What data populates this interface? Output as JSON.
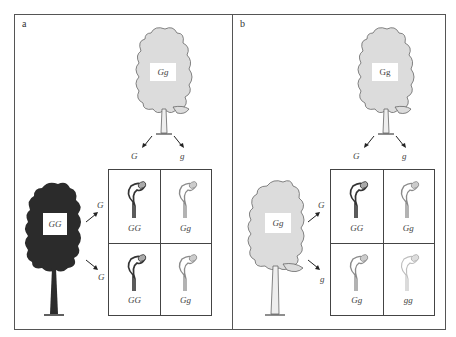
{
  "panels": [
    {
      "label": "a",
      "top_tree": {
        "genotype": "Gg",
        "shade": "light"
      },
      "top_gametes": [
        "G",
        "g"
      ],
      "left_tree": {
        "genotype": "GG",
        "shade": "dark"
      },
      "left_gametes": [
        "G",
        "G"
      ],
      "grid": [
        [
          "GG",
          "Gg"
        ],
        [
          "GG",
          "Gg"
        ]
      ],
      "grid_shades": [
        [
          "dark",
          "medium"
        ],
        [
          "dark",
          "medium"
        ]
      ]
    },
    {
      "label": "b",
      "top_tree": {
        "genotype": "Gg",
        "shade": "light"
      },
      "top_gametes": [
        "G",
        "g"
      ],
      "left_tree": {
        "genotype": "Gg",
        "shade": "light"
      },
      "left_gametes": [
        "G",
        "g"
      ],
      "grid": [
        [
          "GG",
          "Gg"
        ],
        [
          "Gg",
          "gg"
        ]
      ],
      "grid_shades": [
        [
          "dark",
          "medium"
        ],
        [
          "medium",
          "pale"
        ]
      ]
    }
  ],
  "colors": {
    "dark_tree": "#2b2b2b",
    "light_tree": "#dcdcdc",
    "border": "#555555",
    "seedling_dark": "#333333",
    "seedling_medium": "#8a8a8a",
    "seedling_pale": "#bdbdbd"
  }
}
